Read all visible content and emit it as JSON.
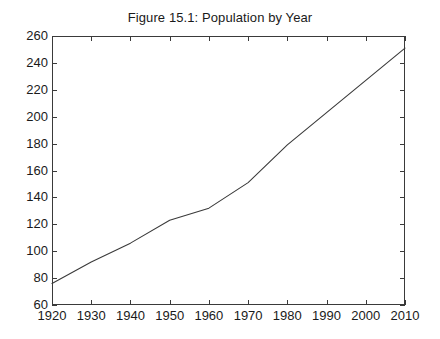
{
  "chart_data": {
    "type": "line",
    "title": "Figure 15.1: Population by Year",
    "xlabel": "",
    "ylabel": "",
    "x": [
      1920,
      1930,
      1940,
      1950,
      1960,
      1970,
      1980,
      1990,
      2000,
      2010
    ],
    "values": [
      76,
      92,
      106,
      123,
      132,
      151,
      179,
      203,
      227,
      251
    ],
    "series": [
      {
        "name": "Population",
        "values": [
          76,
          92,
          106,
          123,
          132,
          151,
          179,
          203,
          227,
          251
        ]
      }
    ],
    "xlim": [
      1920,
      2010
    ],
    "ylim": [
      60,
      260
    ],
    "xticks": [
      1920,
      1930,
      1940,
      1950,
      1960,
      1970,
      1980,
      1990,
      2000,
      2010
    ],
    "yticks": [
      60,
      80,
      100,
      120,
      140,
      160,
      180,
      200,
      220,
      240,
      260
    ],
    "xtick_labels": [
      "1920",
      "1930",
      "1940",
      "1950",
      "1960",
      "1970",
      "1980",
      "1990",
      "2000",
      "2010"
    ],
    "ytick_labels": [
      "60",
      "80",
      "100",
      "120",
      "140",
      "160",
      "180",
      "200",
      "220",
      "240",
      "260"
    ],
    "grid": false,
    "legend": false,
    "legend_position": "none",
    "line_color": "#3a3a3a",
    "background_color": "#ffffff",
    "axis_color": "#3a3a3a"
  }
}
